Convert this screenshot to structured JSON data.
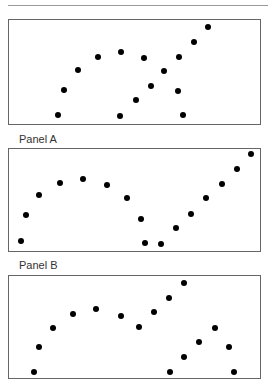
{
  "figure": {
    "panels": [
      {
        "id": "top",
        "label": "",
        "box": {
          "top": 19,
          "height": 106
        },
        "points": [
          [
            58,
            115
          ],
          [
            64,
            90
          ],
          [
            78,
            70
          ],
          [
            98,
            57
          ],
          [
            121,
            52
          ],
          [
            144,
            58
          ],
          [
            164,
            71
          ],
          [
            179,
            57
          ],
          [
            194,
            42
          ],
          [
            208,
            27
          ],
          [
            120,
            116
          ],
          [
            136,
            100
          ],
          [
            151,
            86
          ],
          [
            178,
            91
          ],
          [
            183,
            115
          ]
        ]
      },
      {
        "id": "A",
        "label": "Panel A",
        "label_top": 133,
        "box": {
          "top": 148,
          "height": 104
        },
        "points": [
          [
            21,
            241
          ],
          [
            26,
            215
          ],
          [
            39,
            195
          ],
          [
            60,
            183
          ],
          [
            83,
            179
          ],
          [
            107,
            185
          ],
          [
            127,
            198
          ],
          [
            141,
            219
          ],
          [
            145,
            243
          ],
          [
            161,
            244
          ],
          [
            176,
            228
          ],
          [
            191,
            214
          ],
          [
            206,
            198
          ],
          [
            222,
            184
          ],
          [
            237,
            169
          ],
          [
            251,
            154
          ]
        ]
      },
      {
        "id": "B",
        "label": "Panel B",
        "label_top": 259,
        "box": {
          "top": 275,
          "height": 104
        },
        "points": [
          [
            34,
            372
          ],
          [
            39,
            347
          ],
          [
            53,
            328
          ],
          [
            73,
            314
          ],
          [
            96,
            309
          ],
          [
            121,
            316
          ],
          [
            139,
            327
          ],
          [
            154,
            312
          ],
          [
            169,
            298
          ],
          [
            184,
            283
          ],
          [
            170,
            372
          ],
          [
            184,
            357
          ],
          [
            199,
            342
          ],
          [
            215,
            328
          ],
          [
            229,
            347
          ],
          [
            234,
            372
          ]
        ]
      }
    ]
  }
}
